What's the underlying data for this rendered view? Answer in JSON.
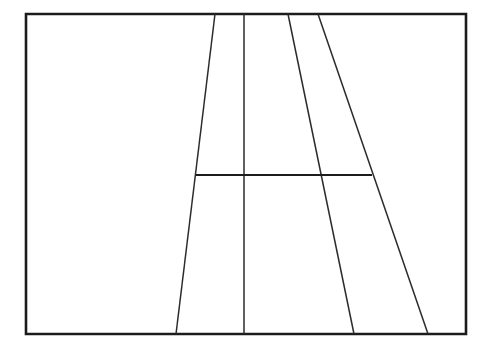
{
  "figure": {
    "title": "Perspective line drawing of a tennis court",
    "canvas_width": 489,
    "canvas_height": 355,
    "background_color": "#ffffff",
    "line_color": "#2b2b2b",
    "frame_color": "#1c1c1c"
  },
  "frame": {
    "name": "image-border",
    "x": 26,
    "y": 14,
    "width": 440,
    "height": 320,
    "stroke_width": 2.6,
    "fill": "#ffffff"
  },
  "chart_data": {
    "type": "line",
    "title": "Perspective line drawing of a tennis court",
    "xlabel": "",
    "ylabel": "",
    "xlim": [
      0,
      489
    ],
    "ylim": [
      0,
      355
    ],
    "grid": false,
    "legend": "none",
    "coordinate_note": "Pixel coordinates, origin at top-left of the 489x355 canvas.",
    "series": [
      {
        "name": "frame-border",
        "role": "outer rectangular frame",
        "closed": true,
        "stroke_width": 2.6,
        "color": "#1c1c1c",
        "points": [
          [
            26,
            14
          ],
          [
            466,
            14
          ],
          [
            466,
            334
          ],
          [
            26,
            334
          ],
          [
            26,
            14
          ]
        ]
      },
      {
        "name": "left-sideline",
        "role": "left outer court sideline receding to vanishing point",
        "closed": false,
        "stroke_width": 1.5,
        "color": "#2b2b2b",
        "points": [
          [
            215,
            14
          ],
          [
            176,
            334
          ]
        ]
      },
      {
        "name": "center-service-line",
        "role": "center line running down the middle of the court",
        "closed": false,
        "stroke_width": 1.5,
        "color": "#2b2b2b",
        "points": [
          [
            244,
            14
          ],
          [
            244,
            334
          ]
        ]
      },
      {
        "name": "right-singles-sideline",
        "role": "inner right sideline",
        "closed": false,
        "stroke_width": 1.5,
        "color": "#2b2b2b",
        "points": [
          [
            288,
            14
          ],
          [
            354,
            334
          ]
        ]
      },
      {
        "name": "right-doubles-sideline",
        "role": "outer right sideline",
        "closed": false,
        "stroke_width": 1.5,
        "color": "#2b2b2b",
        "points": [
          [
            318,
            14
          ],
          [
            428,
            334
          ]
        ]
      },
      {
        "name": "service-line",
        "role": "horizontal service line crossing the court",
        "closed": false,
        "stroke_width": 2.2,
        "color": "#1c1c1c",
        "points": [
          [
            196,
            175
          ],
          [
            372,
            175
          ]
        ]
      }
    ],
    "annotations": [
      {
        "name": "service-line-left-endpoint",
        "x": 196,
        "y": 175,
        "description": "Service line meets the left sideline"
      },
      {
        "name": "service-line-center-crossing",
        "x": 244,
        "y": 175,
        "description": "Service line crosses the center line"
      },
      {
        "name": "service-line-inner-right-crossing",
        "x": 318,
        "y": 175,
        "description": "Service line crosses the inner right sideline"
      },
      {
        "name": "service-line-right-endpoint",
        "x": 372,
        "y": 175,
        "description": "Service line meets the outer right sideline"
      }
    ]
  }
}
